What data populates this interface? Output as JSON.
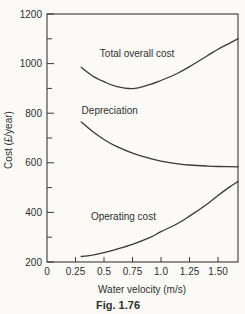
{
  "colors": {
    "ink": "#3a3a3a",
    "text": "#2f2f2f",
    "paper": "#fbfaf7"
  },
  "chart_data": {
    "type": "line",
    "title": "Fig. 1.76",
    "xlabel": "Water velocity (m/s)",
    "ylabel": "Cost (£/year)",
    "xlim": [
      0,
      1.675
    ],
    "ylim": [
      200,
      1200
    ],
    "grid": false,
    "legend": "inline-labels",
    "x_ticks": [
      0,
      0.25,
      0.5,
      0.75,
      1.0,
      1.25,
      1.5
    ],
    "x_tick_labels": [
      "0",
      "0.25",
      "0.5",
      "0.75",
      "1.0",
      "1.25",
      "1.50"
    ],
    "y_ticks": [
      200,
      400,
      600,
      800,
      1000,
      1200
    ],
    "y_tick_labels": [
      "200",
      "400",
      "600",
      "800",
      "1000",
      "1200"
    ],
    "y_minor_ticks": [
      300,
      500,
      700,
      900,
      1100
    ],
    "series": [
      {
        "name": "Total overall cost",
        "label_x": 0.79,
        "label_y": 1040,
        "points": [
          [
            0.3,
            985
          ],
          [
            0.4,
            950
          ],
          [
            0.5,
            927
          ],
          [
            0.6,
            909
          ],
          [
            0.75,
            899
          ],
          [
            0.9,
            915
          ],
          [
            1.0,
            932
          ],
          [
            1.15,
            962
          ],
          [
            1.25,
            988
          ],
          [
            1.4,
            1030
          ],
          [
            1.5,
            1058
          ],
          [
            1.6,
            1082
          ],
          [
            1.675,
            1100
          ]
        ]
      },
      {
        "name": "Depreciation",
        "label_x": 0.55,
        "label_y": 812,
        "points": [
          [
            0.3,
            765
          ],
          [
            0.4,
            726
          ],
          [
            0.5,
            694
          ],
          [
            0.6,
            668
          ],
          [
            0.75,
            639
          ],
          [
            0.9,
            618
          ],
          [
            1.0,
            607
          ],
          [
            1.15,
            596
          ],
          [
            1.25,
            591
          ],
          [
            1.4,
            587
          ],
          [
            1.5,
            585
          ],
          [
            1.675,
            584
          ]
        ]
      },
      {
        "name": "Operating cost",
        "label_x": 0.67,
        "label_y": 385,
        "points": [
          [
            0.3,
            222
          ],
          [
            0.4,
            228
          ],
          [
            0.5,
            238
          ],
          [
            0.6,
            250
          ],
          [
            0.75,
            271
          ],
          [
            0.9,
            298
          ],
          [
            1.0,
            322
          ],
          [
            1.15,
            356
          ],
          [
            1.25,
            385
          ],
          [
            1.4,
            432
          ],
          [
            1.5,
            468
          ],
          [
            1.6,
            502
          ],
          [
            1.675,
            525
          ]
        ]
      }
    ]
  }
}
